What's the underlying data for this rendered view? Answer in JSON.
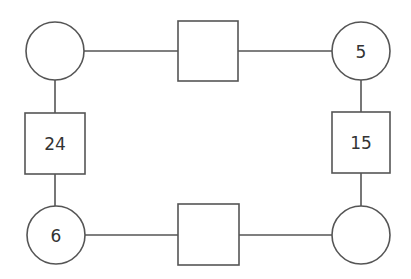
{
  "diagram": {
    "type": "number-puzzle-rectangle",
    "nodes": {
      "circle_top_left": {
        "shape": "circle",
        "value": ""
      },
      "square_top": {
        "shape": "square",
        "value": ""
      },
      "circle_top_right": {
        "shape": "circle",
        "value": "5"
      },
      "square_left": {
        "shape": "square",
        "value": "24"
      },
      "square_right": {
        "shape": "square",
        "value": "15"
      },
      "circle_bottom_left": {
        "shape": "circle",
        "value": "6"
      },
      "square_bottom": {
        "shape": "square",
        "value": ""
      },
      "circle_bottom_right": {
        "shape": "circle",
        "value": ""
      }
    },
    "edges": [
      [
        "circle_top_left",
        "square_top"
      ],
      [
        "square_top",
        "circle_top_right"
      ],
      [
        "circle_top_right",
        "square_right"
      ],
      [
        "square_right",
        "circle_bottom_right"
      ],
      [
        "circle_bottom_right",
        "square_bottom"
      ],
      [
        "square_bottom",
        "circle_bottom_left"
      ],
      [
        "circle_bottom_left",
        "square_left"
      ],
      [
        "square_left",
        "circle_top_left"
      ]
    ],
    "colors": {
      "stroke": "#555555",
      "text": "#333333",
      "background": "#ffffff"
    }
  }
}
